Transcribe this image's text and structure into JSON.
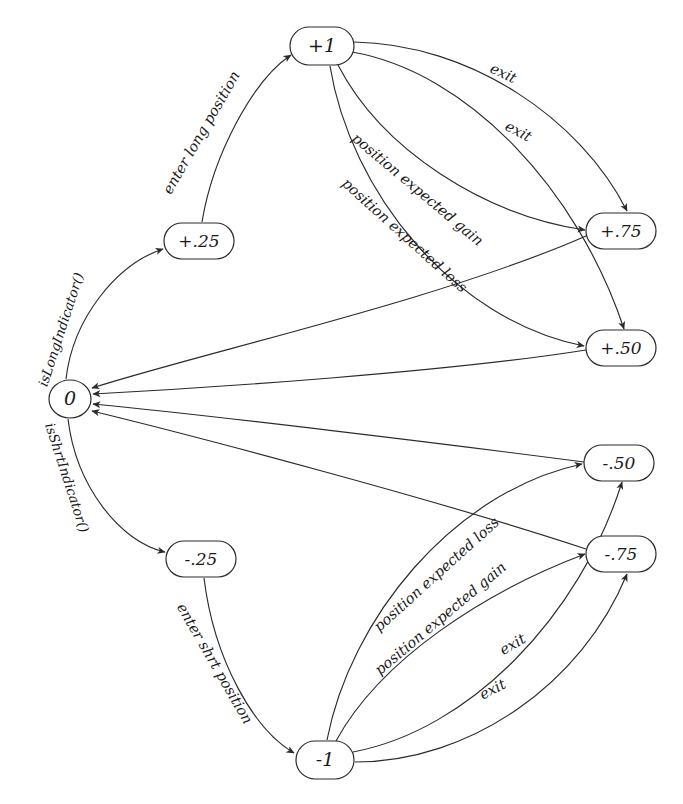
{
  "diagram": {
    "background": "#ffffff",
    "stroke_color": "#2b2b2b",
    "text_color": "#1a1a1a",
    "nodes": [
      {
        "id": "p1",
        "label": "+1",
        "x": 322,
        "y": 46,
        "rx": 32,
        "ry": 19,
        "shape": "rounded-rect"
      },
      {
        "id": "p25",
        "label": "+.25",
        "x": 199,
        "y": 241,
        "rx": 35,
        "ry": 18,
        "shape": "rounded-rect"
      },
      {
        "id": "p75",
        "label": "+.75",
        "x": 621,
        "y": 231,
        "rx": 35,
        "ry": 18,
        "shape": "rounded-rect"
      },
      {
        "id": "p50",
        "label": "+.50",
        "x": 621,
        "y": 348,
        "rx": 35,
        "ry": 18,
        "shape": "rounded-rect"
      },
      {
        "id": "zero",
        "label": "0",
        "x": 70,
        "y": 399,
        "rx": 21,
        "ry": 19,
        "shape": "ellipse"
      },
      {
        "id": "n50",
        "label": "-.50",
        "x": 619,
        "y": 463,
        "rx": 35,
        "ry": 18,
        "shape": "rounded-rect"
      },
      {
        "id": "n75",
        "label": "-.75",
        "x": 621,
        "y": 554,
        "rx": 35,
        "ry": 18,
        "shape": "rounded-rect"
      },
      {
        "id": "n25",
        "label": "-.25",
        "x": 201,
        "y": 559,
        "rx": 35,
        "ry": 18,
        "shape": "rounded-rect"
      },
      {
        "id": "n1",
        "label": "-1",
        "x": 325,
        "y": 760,
        "rx": 29,
        "ry": 19,
        "shape": "rounded-rect"
      }
    ],
    "edges": [
      {
        "id": "e1",
        "from": "zero",
        "to": "p25",
        "label": "isLongIndicator()",
        "label_x": 62,
        "label_y": 330,
        "label_rot": -72
      },
      {
        "id": "e2",
        "from": "p25",
        "to": "p1",
        "label": "enter long position",
        "label_x": 202,
        "label_y": 133,
        "label_rot": -60
      },
      {
        "id": "e3",
        "from": "p1",
        "to": "p75",
        "label": "exit",
        "label_x": 503,
        "label_y": 74,
        "label_rot": 25
      },
      {
        "id": "e4",
        "from": "p1",
        "to": "p50",
        "label": "exit",
        "label_x": 518,
        "label_y": 132,
        "label_rot": 28
      },
      {
        "id": "e5",
        "from": "p1",
        "to": "p75",
        "label": "position expected gain",
        "label_x": 417,
        "label_y": 190,
        "label_rot": 40
      },
      {
        "id": "e6",
        "from": "p1",
        "to": "p50",
        "label": "position expected loss",
        "label_x": 404,
        "label_y": 236,
        "label_rot": 42
      },
      {
        "id": "e7",
        "from": "p75",
        "to": "zero",
        "label": "",
        "label_x": 0,
        "label_y": 0,
        "label_rot": 0
      },
      {
        "id": "e8",
        "from": "p50",
        "to": "zero",
        "label": "",
        "label_x": 0,
        "label_y": 0,
        "label_rot": 0
      },
      {
        "id": "e9",
        "from": "n50",
        "to": "zero",
        "label": "",
        "label_x": 0,
        "label_y": 0,
        "label_rot": 0
      },
      {
        "id": "e10",
        "from": "n75",
        "to": "zero",
        "label": "",
        "label_x": 0,
        "label_y": 0,
        "label_rot": 0
      },
      {
        "id": "e11",
        "from": "zero",
        "to": "n25",
        "label": "isShrtIndicator()",
        "label_x": 66,
        "label_y": 478,
        "label_rot": 72
      },
      {
        "id": "e12",
        "from": "n25",
        "to": "n1",
        "label": "enter shrt position",
        "label_x": 214,
        "label_y": 664,
        "label_rot": 60
      },
      {
        "id": "e13",
        "from": "n1",
        "to": "n50",
        "label": "position expected loss",
        "label_x": 437,
        "label_y": 575,
        "label_rot": -42
      },
      {
        "id": "e14",
        "from": "n1",
        "to": "n75",
        "label": "position expected gain",
        "label_x": 441,
        "label_y": 619,
        "label_rot": -40
      },
      {
        "id": "e15",
        "from": "n1",
        "to": "n50",
        "label": "exit",
        "label_x": 513,
        "label_y": 645,
        "label_rot": -30
      },
      {
        "id": "e16",
        "from": "n1",
        "to": "n75",
        "label": "exit",
        "label_x": 493,
        "label_y": 690,
        "label_rot": -27
      }
    ],
    "edge_label_texts": {
      "is_long_indicator": "isLongIndicator()",
      "is_shrt_indicator": "isShrtIndicator()",
      "enter_long_position": "enter long position",
      "enter_shrt_position": "enter shrt position",
      "position_expected_gain": "position expected gain",
      "position_expected_loss": "position expected loss",
      "exit": "exit"
    }
  }
}
